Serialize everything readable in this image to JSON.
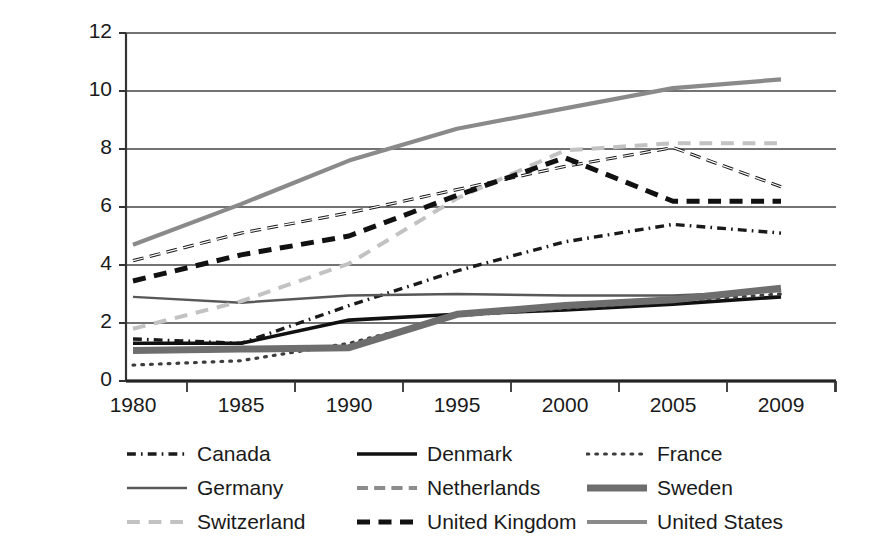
{
  "chart_data": {
    "type": "line",
    "title": "",
    "subtitle": "",
    "xlabel": "",
    "ylabel": "",
    "x": [
      1980,
      1985,
      1990,
      1995,
      2000,
      2005,
      2009
    ],
    "xtick_labels": [
      "1980",
      "1985",
      "1990",
      "1995",
      "2000",
      "2005",
      "2009"
    ],
    "ytick_labels": [
      "0",
      "2",
      "4",
      "6",
      "8",
      "10",
      "12"
    ],
    "ylim": [
      0,
      12
    ],
    "ytick_step": 2,
    "grid": "horizontal",
    "legend_position": "bottom",
    "legend_columns": 3,
    "series": [
      {
        "name": "Canada",
        "values": [
          1.45,
          1.3,
          2.6,
          3.8,
          4.8,
          5.4,
          5.1
        ],
        "color": "#1a1a1a",
        "dash": "dash-dot",
        "width": 3.4
      },
      {
        "name": "Denmark",
        "values": [
          1.3,
          1.3,
          2.1,
          2.3,
          2.45,
          2.65,
          2.9
        ],
        "color": "#111111",
        "dash": "solid",
        "width": 3.6
      },
      {
        "name": "France",
        "values": [
          0.55,
          0.7,
          1.3,
          2.25,
          2.5,
          2.75,
          3.0
        ],
        "color": "#3d3d3d",
        "dash": "dotted",
        "width": 3.2
      },
      {
        "name": "Germany",
        "values": [
          2.9,
          2.7,
          2.95,
          3.0,
          2.95,
          2.95,
          3.1
        ],
        "color": "#585858",
        "dash": "solid",
        "width": 2.4
      },
      {
        "name": "Netherlands",
        "values": [
          4.15,
          5.1,
          5.8,
          6.6,
          7.4,
          8.05,
          6.7
        ],
        "color": "#1a1a1a",
        "dash": "dashed-open",
        "width": 3.2
      },
      {
        "name": "Sweden",
        "values": [
          1.05,
          1.1,
          1.15,
          2.3,
          2.6,
          2.8,
          3.2
        ],
        "color": "#6e6e6e",
        "dash": "solid",
        "width": 7.0
      },
      {
        "name": "Switzerland",
        "values": [
          1.8,
          2.75,
          4.05,
          6.3,
          7.95,
          8.2,
          8.2
        ],
        "color": "#c2c2c2",
        "dash": "dashed",
        "width": 4.0
      },
      {
        "name": "United Kingdom",
        "values": [
          3.45,
          4.35,
          5.0,
          6.4,
          7.7,
          6.2,
          6.2
        ],
        "color": "#111111",
        "dash": "dashed-heavy",
        "width": 5.0
      },
      {
        "name": "United States",
        "values": [
          4.7,
          6.1,
          7.6,
          8.7,
          9.4,
          10.1,
          10.4
        ],
        "color": "#8a8a8a",
        "dash": "solid",
        "width": 4.2
      }
    ]
  },
  "legend": {
    "items": [
      {
        "label": "Canada",
        "swatch": "canada-dash-dot-swatch"
      },
      {
        "label": "Denmark",
        "swatch": "denmark-solid-swatch"
      },
      {
        "label": "France",
        "swatch": "france-dotted-swatch"
      },
      {
        "label": "Germany",
        "swatch": "germany-thin-solid-swatch"
      },
      {
        "label": "Netherlands",
        "swatch": "netherlands-open-dash-swatch"
      },
      {
        "label": "Sweden",
        "swatch": "sweden-thick-solid-swatch"
      },
      {
        "label": "Switzerland",
        "swatch": "switzerland-light-dash-swatch"
      },
      {
        "label": "United Kingdom",
        "swatch": "uk-heavy-dash-swatch"
      },
      {
        "label": "United States",
        "swatch": "us-gray-solid-swatch"
      }
    ]
  },
  "axes": {
    "y_labels": [
      "12",
      "10",
      "8",
      "6",
      "4",
      "2",
      "0"
    ],
    "x_labels": [
      "1980",
      "1985",
      "1990",
      "1995",
      "2000",
      "2005",
      "2009"
    ]
  }
}
